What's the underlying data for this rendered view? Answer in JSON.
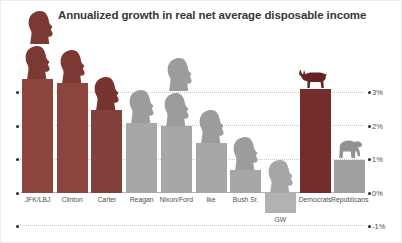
{
  "chart_data": {
    "type": "bar",
    "title": "Annualized growth in real net average disposable income",
    "xlabel": "",
    "ylabel": "",
    "ylim": [
      -1,
      3.5
    ],
    "grid": "dotted horizontal",
    "legend": "none",
    "unit": "%",
    "yticks": [
      {
        "label": "3%",
        "value": 3
      },
      {
        "label": "2%",
        "value": 2
      },
      {
        "label": "1%",
        "value": 1
      },
      {
        "label": "0%",
        "value": 0
      },
      {
        "label": "-1%",
        "value": -1
      }
    ],
    "categories": [
      "JFK/LBJ",
      "Clinton",
      "Carter",
      "Reagan",
      "Nixon/Ford",
      "Ike",
      "Bush Sr.",
      "GW",
      "Democrats",
      "Republicans"
    ],
    "values": [
      3.4,
      3.3,
      2.5,
      2.1,
      2.0,
      1.5,
      0.7,
      -0.6,
      3.1,
      1.0
    ],
    "bars": [
      {
        "label": "JFK/LBJ",
        "value": 3.4,
        "party": "Democrat",
        "heads": 2,
        "color": "#8e443e",
        "head_color": "#7c3833"
      },
      {
        "label": "Clinton",
        "value": 3.3,
        "party": "Democrat",
        "heads": 1,
        "color": "#8e443e",
        "head_color": "#7c3833"
      },
      {
        "label": "Carter",
        "value": 2.5,
        "party": "Democrat",
        "heads": 1,
        "color": "#84403a",
        "head_color": "#76332f"
      },
      {
        "label": "Reagan",
        "value": 2.1,
        "party": "Republican",
        "heads": 1,
        "color": "#a7a7a7",
        "head_color": "#9c9c9c"
      },
      {
        "label": "Nixon/Ford",
        "value": 2.0,
        "party": "Republican",
        "heads": 2,
        "color": "#a7a7a7",
        "head_color": "#9c9c9c"
      },
      {
        "label": "Ike",
        "value": 1.5,
        "party": "Republican",
        "heads": 1,
        "color": "#a7a7a7",
        "head_color": "#9c9c9c"
      },
      {
        "label": "Bush Sr.",
        "value": 0.7,
        "party": "Republican",
        "heads": 1,
        "color": "#a7a7a7",
        "head_color": "#9c9c9c"
      },
      {
        "label": "GW",
        "value": -0.6,
        "party": "Republican",
        "heads": 1,
        "color": "#b2b2b2",
        "head_color": "#a6a6a6",
        "label_below_bar": true
      },
      {
        "label": "Democrats",
        "value": 3.1,
        "party": "Democrat",
        "icon": "donkey",
        "color": "#732e2c",
        "icon_color": "#632422"
      },
      {
        "label": "Republicans",
        "value": 1.0,
        "party": "Republican",
        "icon": "elephant",
        "color": "#a0a0a0",
        "icon_color": "#919191"
      }
    ]
  },
  "colors": {
    "grid": "#c8c8c8",
    "axis": "#b2b2b2",
    "tick_dot": "#2b2b2b",
    "title_text": "#383838",
    "label_text": "#4f4f4f"
  }
}
